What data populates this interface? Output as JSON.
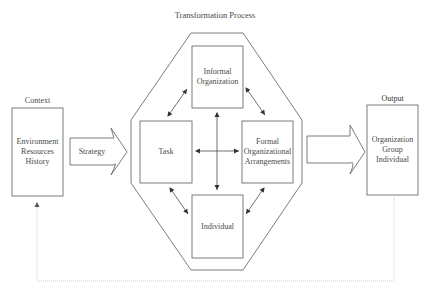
{
  "diagram": {
    "title": "Transformation Process",
    "context": {
      "label": "Context",
      "lines": [
        "Environment",
        "Resources",
        "History"
      ]
    },
    "strategy": {
      "label": "Strategy"
    },
    "components": {
      "informal": {
        "lines": [
          "Informal",
          "Organization"
        ]
      },
      "task": {
        "lines": [
          "Task"
        ]
      },
      "formal": {
        "lines": [
          "Formal",
          "Organizational",
          "Arrangements"
        ]
      },
      "individual": {
        "lines": [
          "Individual"
        ]
      }
    },
    "output": {
      "label": "Output",
      "lines": [
        "Organization",
        "Group",
        "Individual"
      ]
    },
    "colors": {
      "stroke": "#6e6e6e",
      "text": "#4a4a4a",
      "feedback": "#c8c8c8"
    }
  }
}
